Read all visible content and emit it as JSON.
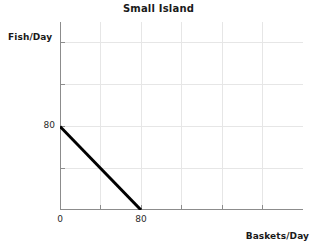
{
  "chart_data": {
    "type": "line",
    "title": "Small Island",
    "xlabel": "Baskets/Day",
    "ylabel": "Fish/Day",
    "xlim": [
      0,
      240
    ],
    "ylim": [
      0,
      180
    ],
    "grid": true,
    "legend": "none",
    "x_tick_labels": [
      "0",
      "80"
    ],
    "x_tick_values": [
      0,
      80
    ],
    "y_tick_labels": [
      "80"
    ],
    "y_tick_values": [
      80
    ],
    "x_gridlines": [
      0,
      40,
      80,
      120,
      160,
      200
    ],
    "y_gridlines": [
      0,
      40,
      80,
      120,
      160
    ],
    "series": [
      {
        "name": "Production Possibilities Frontier",
        "color": "#000000",
        "line_width": 3,
        "x": [
          0,
          80
        ],
        "y": [
          80,
          0
        ],
        "points": [
          {
            "x": 0,
            "y": 80
          },
          {
            "x": 80,
            "y": 0
          }
        ]
      }
    ],
    "annotations": []
  },
  "style": {
    "background": "#ffffff",
    "grid_color": "#e6e6e6",
    "axis_color": "#8c8c8c",
    "text_color": "#1a1a1a",
    "line_color": "#000000"
  },
  "axes": {
    "y_label_tick_80": "80",
    "x_label_tick_0": "0",
    "x_label_tick_80": "80"
  }
}
